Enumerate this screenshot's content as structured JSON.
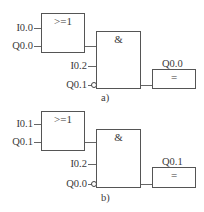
{
  "diagrams": [
    {
      "caption": "a)",
      "or_block": {
        "label": ">=1",
        "inputs": [
          "I0.0",
          "Q0.0"
        ]
      },
      "and_block": {
        "label": "&",
        "inputs": [
          "I0.2",
          "Q0.1"
        ],
        "negated_input": "Q0.1"
      },
      "output_block": {
        "label": "=",
        "output": "Q0.0"
      }
    },
    {
      "caption": "b)",
      "or_block": {
        "label": ">=1",
        "inputs": [
          "I0.1",
          "Q0.1"
        ]
      },
      "and_block": {
        "label": "&",
        "inputs": [
          "I0.2",
          "Q0.0"
        ],
        "negated_input": "Q0.0"
      },
      "output_block": {
        "label": "=",
        "output": "Q0.1"
      }
    }
  ]
}
